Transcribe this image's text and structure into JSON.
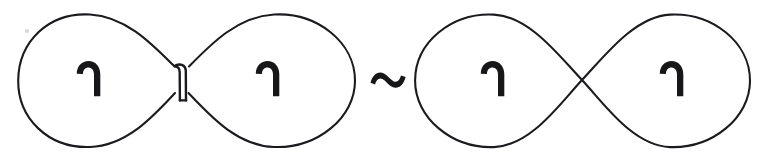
{
  "figure": {
    "caption": "Pinched figure-eight curve is equivalent to a transversal figure-eight curve",
    "background_color": "#ffffff",
    "ink_color": "#1b1b1f",
    "mark_color": "#17171a",
    "stroke_width": 2.1,
    "canvas": {
      "width": 769,
      "height": 159
    }
  },
  "relation": {
    "symbol": "~",
    "name": "tilde-equivalence",
    "label": "is equivalent to",
    "x": 387,
    "y": 80
  },
  "shapes": [
    {
      "id": "left-figure-eight",
      "name": "pinched-figure-eight",
      "crossing_type": "clasp",
      "crossing_label": "pinched clasp",
      "crossing_x": 180,
      "crossing_y": 79,
      "bbox": {
        "x": 18,
        "y": 14,
        "width": 337,
        "height": 134
      },
      "lobes": [
        {
          "id": "left-figure-lobe-left",
          "name": "left-lobe",
          "center_x": 102,
          "center_y": 80
        },
        {
          "id": "left-figure-lobe-right",
          "name": "right-lobe",
          "center_x": 264,
          "center_y": 80
        }
      ]
    },
    {
      "id": "right-figure-eight",
      "name": "transversal-figure-eight",
      "crossing_type": "transversal",
      "crossing_label": "simple crossing",
      "crossing_x": 582,
      "crossing_y": 80,
      "bbox": {
        "x": 415,
        "y": 14,
        "width": 335,
        "height": 134
      },
      "lobes": [
        {
          "id": "right-figure-lobe-left",
          "name": "left-lobe",
          "center_x": 499,
          "center_y": 80
        },
        {
          "id": "right-figure-lobe-right",
          "name": "right-lobe",
          "center_x": 678,
          "center_y": 80
        }
      ]
    }
  ],
  "orientation_marks": [
    {
      "id": "hook-1",
      "name": "orientation-hook",
      "glyph": "comma-hook",
      "x": 75,
      "y": 61,
      "rotation": 0
    },
    {
      "id": "hook-2",
      "name": "orientation-hook",
      "glyph": "comma-hook",
      "x": 254,
      "y": 61,
      "rotation": 0
    },
    {
      "id": "hook-3",
      "name": "orientation-hook",
      "glyph": "comma-hook",
      "x": 479,
      "y": 61,
      "rotation": 0
    },
    {
      "id": "hook-4",
      "name": "orientation-hook",
      "glyph": "comma-hook",
      "x": 658,
      "y": 61,
      "rotation": 0
    }
  ],
  "artifacts": [
    {
      "id": "speck-1",
      "name": "scan-speck",
      "x": 27,
      "y": 31,
      "r": 2.1
    }
  ]
}
